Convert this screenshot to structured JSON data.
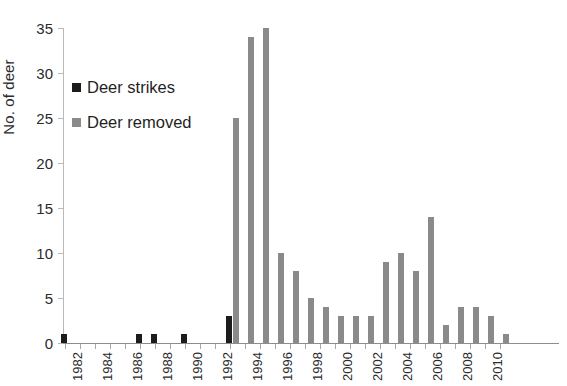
{
  "chart_data": {
    "type": "bar",
    "title": "",
    "xlabel": "",
    "ylabel": "No. of deer",
    "ylim": [
      0,
      35
    ],
    "ytick_step": 5,
    "yticks": [
      0,
      5,
      10,
      15,
      20,
      25,
      30,
      35
    ],
    "grid": false,
    "legend_position": "upper-left",
    "xtick_labels": [
      "1982",
      "1984",
      "1986",
      "1988",
      "1990",
      "1992",
      "1994",
      "1996",
      "1998",
      "2000",
      "2002",
      "2004",
      "2006",
      "2008",
      "2010"
    ],
    "categories": [
      1982,
      1983,
      1984,
      1985,
      1986,
      1987,
      1988,
      1989,
      1990,
      1991,
      1992,
      1993,
      1994,
      1995,
      1996,
      1997,
      1998,
      1999,
      2000,
      2001,
      2002,
      2003,
      2004,
      2005,
      2006,
      2007,
      2008,
      2009,
      2010,
      2011
    ],
    "series": [
      {
        "name": "Deer strikes",
        "color": "#1c1c1c",
        "values": [
          1,
          0,
          0,
          0,
          0,
          1,
          1,
          0,
          1,
          0,
          0,
          3,
          0,
          0,
          0,
          0,
          0,
          0,
          0,
          0,
          0,
          0,
          0,
          0,
          0,
          0,
          0,
          0,
          0,
          0
        ]
      },
      {
        "name": "Deer removed",
        "color": "#8a8a8a",
        "values": [
          0,
          0,
          0,
          0,
          0,
          0,
          0,
          0,
          0,
          0,
          0,
          25,
          34,
          35,
          10,
          8,
          5,
          4,
          3,
          3,
          3,
          9,
          10,
          8,
          14,
          2,
          4,
          4,
          3,
          1
        ]
      }
    ]
  },
  "legend": {
    "items": [
      {
        "label": "Deer strikes",
        "swatch": "strikes"
      },
      {
        "label": "Deer removed",
        "swatch": "removed"
      }
    ]
  },
  "axis": {
    "y_title": "No. of deer"
  }
}
